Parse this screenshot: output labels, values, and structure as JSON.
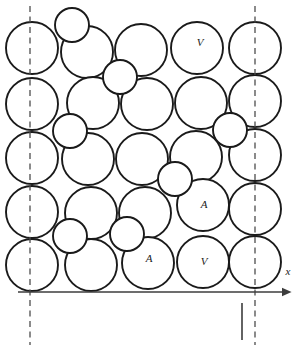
{
  "figure": {
    "width": 301,
    "height": 351,
    "background_color": "#ffffff",
    "line_color": "#1a1a1a",
    "axis_color": "#3d3d3d",
    "guide_color": "#4d4d4d"
  },
  "axis": {
    "name": "x-axis",
    "label": "x",
    "label_x": 288,
    "label_y": 272,
    "y": 292,
    "x_start": 18,
    "x_end": 282,
    "arrow_size": 6,
    "tick": {
      "name": "axis-tick",
      "x": 242,
      "y_top": 303,
      "y_bottom": 340
    }
  },
  "guides": [
    {
      "name": "guide-line-left",
      "x": 30,
      "y_top": 6,
      "y_bottom": 345
    },
    {
      "name": "guide-line-right",
      "x": 255,
      "y_top": 6,
      "y_bottom": 345
    }
  ],
  "host_radius": 26,
  "host_circles": [
    {
      "cx": 32,
      "cy": 48
    },
    {
      "cx": 87,
      "cy": 52
    },
    {
      "cx": 141,
      "cy": 50
    },
    {
      "cx": 197,
      "cy": 48
    },
    {
      "cx": 255,
      "cy": 48
    },
    {
      "cx": 32,
      "cy": 104
    },
    {
      "cx": 93,
      "cy": 103
    },
    {
      "cx": 147,
      "cy": 104
    },
    {
      "cx": 201,
      "cy": 103
    },
    {
      "cx": 255,
      "cy": 101
    },
    {
      "cx": 32,
      "cy": 158
    },
    {
      "cx": 88,
      "cy": 159
    },
    {
      "cx": 142,
      "cy": 159
    },
    {
      "cx": 196,
      "cy": 157
    },
    {
      "cx": 255,
      "cy": 155
    },
    {
      "cx": 32,
      "cy": 212
    },
    {
      "cx": 91,
      "cy": 213
    },
    {
      "cx": 145,
      "cy": 213
    },
    {
      "cx": 203,
      "cy": 205
    },
    {
      "cx": 255,
      "cy": 209
    },
    {
      "cx": 32,
      "cy": 265
    },
    {
      "cx": 91,
      "cy": 265
    },
    {
      "cx": 148,
      "cy": 263
    },
    {
      "cx": 203,
      "cy": 262
    },
    {
      "cx": 255,
      "cy": 262
    }
  ],
  "interstitial_radius": 17,
  "interstitial_circles": [
    {
      "name": "interstitial-diagonal-1",
      "cx": 72,
      "cy": 25,
      "hatch": "diagonal"
    },
    {
      "name": "interstitial-diagonal-2",
      "cx": 120,
      "cy": 77,
      "hatch": "diagonal"
    },
    {
      "name": "interstitial-vertical-1",
      "cx": 70,
      "cy": 131,
      "hatch": "vertical"
    },
    {
      "name": "interstitial-horizontal-1",
      "cx": 230,
      "cy": 130,
      "hatch": "horizontal"
    },
    {
      "name": "interstitial-diagonal-3",
      "cx": 175,
      "cy": 179,
      "hatch": "diagonal"
    },
    {
      "name": "interstitial-diagonal-4",
      "cx": 70,
      "cy": 236,
      "hatch": "diagonal"
    },
    {
      "name": "interstitial-diagonal-5",
      "cx": 127,
      "cy": 234,
      "hatch": "diagonal"
    }
  ],
  "site_labels": [
    {
      "name": "site-label-v-top",
      "text": "V",
      "x": 200,
      "y": 43
    },
    {
      "name": "site-label-a-mid",
      "text": "A",
      "x": 204,
      "y": 205
    },
    {
      "name": "site-label-a-bottom",
      "text": "A",
      "x": 149,
      "y": 259
    },
    {
      "name": "site-label-v-bottom",
      "text": "V",
      "x": 204,
      "y": 262
    }
  ]
}
